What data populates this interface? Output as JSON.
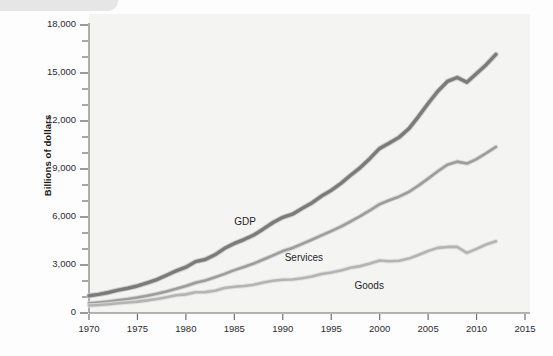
{
  "chart_data": {
    "type": "line",
    "title": "",
    "subtitle": "",
    "xlabel": "",
    "ylabel": "Billions of dollars",
    "xlim": [
      1970,
      2015
    ],
    "ylim": [
      0,
      18000
    ],
    "grid": false,
    "legend_position": "inline-labels",
    "x_ticks": [
      "1970",
      "1975",
      "1980",
      "1985",
      "1990",
      "1995",
      "2000",
      "2005",
      "2010",
      "2015"
    ],
    "x_tick_values": [
      1970,
      1975,
      1980,
      1985,
      1990,
      1995,
      2000,
      2005,
      2010,
      2015
    ],
    "y_ticks": [
      "0",
      "3,000",
      "6,000",
      "9,000",
      "12,000",
      "15,000",
      "18,000"
    ],
    "y_tick_values": [
      0,
      3000,
      6000,
      9000,
      12000,
      15000,
      18000
    ],
    "y_minor_ticks": [
      1000,
      2000,
      4000,
      5000,
      7000,
      8000,
      10000,
      11000,
      13000,
      14000,
      16000,
      17000
    ],
    "x": [
      1970,
      1971,
      1972,
      1973,
      1974,
      1975,
      1976,
      1977,
      1978,
      1979,
      1980,
      1981,
      1982,
      1983,
      1984,
      1985,
      1986,
      1987,
      1988,
      1989,
      1990,
      1991,
      1992,
      1993,
      1994,
      1995,
      1996,
      1997,
      1998,
      1999,
      2000,
      2001,
      2002,
      2003,
      2004,
      2005,
      2006,
      2007,
      2008,
      2009,
      2010,
      2011,
      2012
    ],
    "series": [
      {
        "name": "GDP",
        "color": "#7b7b7b",
        "highlight_color": "#c9c9c9",
        "width": 3.4,
        "label_x": 1985.0,
        "label_y": 5600,
        "values": [
          1076,
          1168,
          1282,
          1429,
          1549,
          1689,
          1878,
          2086,
          2357,
          2632,
          2863,
          3211,
          3345,
          3638,
          4041,
          4347,
          4590,
          4870,
          5253,
          5658,
          5980,
          6174,
          6539,
          6879,
          7309,
          7664,
          8100,
          8609,
          9089,
          9661,
          10285,
          10622,
          10978,
          11511,
          12275,
          13094,
          13856,
          14478,
          14719,
          14419,
          14964,
          15518,
          16163
        ]
      },
      {
        "name": "Services",
        "color": "#9d9d9d",
        "highlight_color": "#d5d5d5",
        "width": 2.6,
        "label_x": 1990.2,
        "label_y": 3350,
        "values": [
          600,
          655,
          720,
          790,
          870,
          965,
          1075,
          1200,
          1350,
          1510,
          1690,
          1890,
          2035,
          2230,
          2445,
          2680,
          2880,
          3090,
          3345,
          3600,
          3870,
          4060,
          4320,
          4580,
          4850,
          5120,
          5400,
          5720,
          6060,
          6420,
          6800,
          7050,
          7270,
          7560,
          7960,
          8400,
          8860,
          9270,
          9460,
          9340,
          9620,
          9990,
          10380
        ]
      },
      {
        "name": "Goods",
        "color": "#b4b4b4",
        "highlight_color": "#dedede",
        "width": 2.6,
        "label_x": 1997.4,
        "label_y": 1650,
        "values": [
          470,
          500,
          545,
          610,
          660,
          710,
          790,
          880,
          990,
          1105,
          1165,
          1300,
          1305,
          1390,
          1560,
          1640,
          1690,
          1770,
          1900,
          2020,
          2080,
          2090,
          2170,
          2280,
          2440,
          2530,
          2660,
          2830,
          2930,
          3090,
          3280,
          3230,
          3270,
          3400,
          3630,
          3870,
          4070,
          4130,
          4130,
          3760,
          4010,
          4280,
          4480
        ]
      }
    ]
  }
}
